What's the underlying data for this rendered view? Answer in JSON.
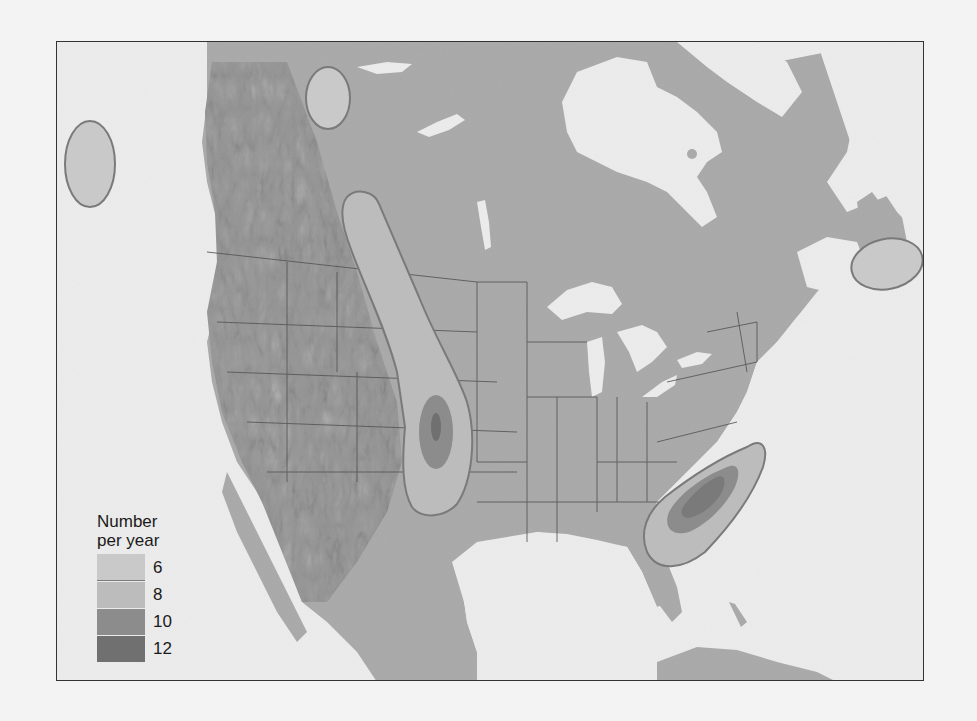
{
  "map": {
    "type": "thematic-map",
    "region": "North America",
    "colors": {
      "ocean": "#ececec",
      "land": "#a9a9a9",
      "terrain_dark": "#8c8c8c",
      "state_border": "#555555",
      "frame_border": "#333333"
    }
  },
  "legend": {
    "title_line1": "Number",
    "title_line2": "per year",
    "items": [
      {
        "label": "6",
        "color": "#c9c9c9"
      },
      {
        "label": "8",
        "color": "#bcbcbc"
      },
      {
        "label": "10",
        "color": "#8c8c8c"
      },
      {
        "label": "12",
        "color": "#707070"
      }
    ]
  },
  "zones": [
    {
      "name": "pacific-offshore-zone",
      "level": "6"
    },
    {
      "name": "alberta-zone",
      "level": "6"
    },
    {
      "name": "great-plains-zone",
      "levels": [
        "8",
        "10",
        "12"
      ]
    },
    {
      "name": "southeast-zone",
      "levels": [
        "8",
        "10",
        "12"
      ]
    },
    {
      "name": "atlantic-offshore-zone",
      "level": "6"
    }
  ]
}
